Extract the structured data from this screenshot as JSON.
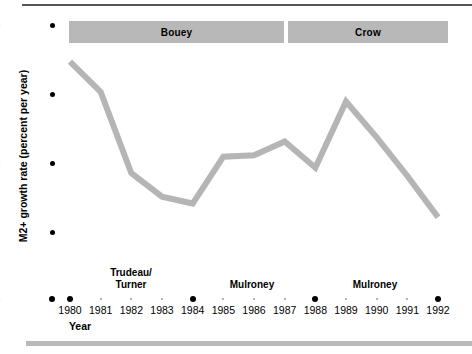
{
  "chart_data": {
    "type": "line",
    "title": "",
    "xlabel": "Year",
    "ylabel": "M2+ growth rate (percent per year)",
    "x": [
      1980,
      1981,
      1982,
      1983,
      1984,
      1985,
      1986,
      1987,
      1988,
      1989,
      1990,
      1991,
      1992
    ],
    "categories": [
      "1980",
      "1981",
      "1982",
      "1983",
      "1984",
      "1985",
      "1986",
      "1987",
      "1988",
      "1989",
      "1990",
      "1991",
      "1992"
    ],
    "values": [
      17.3,
      15.1,
      9.2,
      7.5,
      7.0,
      10.4,
      10.5,
      11.5,
      9.6,
      14.4,
      11.8,
      9.0,
      6.0
    ],
    "series": [
      {
        "name": "M2+ growth rate",
        "values": [
          17.3,
          15.1,
          9.2,
          7.5,
          7.0,
          10.4,
          10.5,
          11.5,
          9.6,
          14.4,
          11.8,
          9.0,
          6.0
        ],
        "color": "#b5b5b5"
      }
    ],
    "ylim": [
      0,
      20
    ],
    "yticks": [
      0,
      5,
      10,
      15,
      20
    ],
    "ytick_labels": [
      "0",
      "5",
      "10",
      "15",
      "20"
    ],
    "xlim": [
      1980,
      1992
    ],
    "major_xticks": [
      "1980",
      "1984",
      "1988",
      "1992"
    ],
    "grid": false,
    "legend": "none",
    "annotations": {
      "governors": [
        {
          "label": "Bouey",
          "start": 1980,
          "end": 1987
        },
        {
          "label": "Crow",
          "start": 1987,
          "end": 1992
        }
      ],
      "prime_ministers": [
        {
          "label": "Trudeau/\nTurner",
          "line1": "Trudeau/",
          "line2": "Turner",
          "center_year": 1982
        },
        {
          "label": "Mulroney",
          "line1": "Mulroney",
          "line2": "",
          "center_year": 1986
        },
        {
          "label": "Mulroney",
          "line1": "Mulroney",
          "line2": "",
          "center_year": 1990
        }
      ]
    }
  },
  "axis": {
    "y_label": "M2+ growth rate (percent per year)",
    "x_label": "Year",
    "y_ticks": [
      "20",
      "15",
      "10",
      "5",
      "0"
    ],
    "x_ticks": [
      "1980",
      "1981",
      "1982",
      "1983",
      "1984",
      "1985",
      "1986",
      "1987",
      "1988",
      "1989",
      "1990",
      "1991",
      "1992"
    ]
  },
  "banners": {
    "left": "Bouey",
    "right": "Crow"
  },
  "era_labels": {
    "trudeau_line1": "Trudeau/",
    "trudeau_line2": "Turner",
    "mulroney_1": "Mulroney",
    "mulroney_2": "Mulroney"
  },
  "colors": {
    "line": "#b5b5b5",
    "banner": "#b8b8b8",
    "rule_top": "#555555",
    "rule_bottom": "#b9b9b9",
    "text": "#000000"
  }
}
